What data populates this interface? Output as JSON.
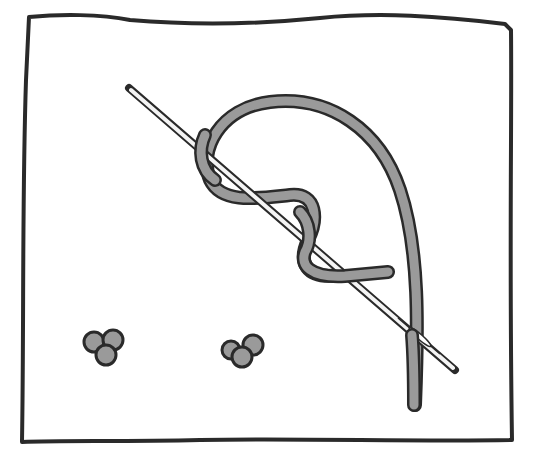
{
  "diagram": {
    "subject": "French knot embroidery stitch",
    "colors": {
      "background": "#ffffff",
      "outline": "#2a2a2a",
      "thread": "#9a9a9a",
      "needle": "#f4f4f4"
    },
    "elements": [
      {
        "name": "fabric",
        "shape": "square"
      },
      {
        "name": "needle",
        "shape": "line"
      },
      {
        "name": "thread-wrapped",
        "wraps": 2
      },
      {
        "name": "finished-knot",
        "count": 2
      }
    ]
  }
}
